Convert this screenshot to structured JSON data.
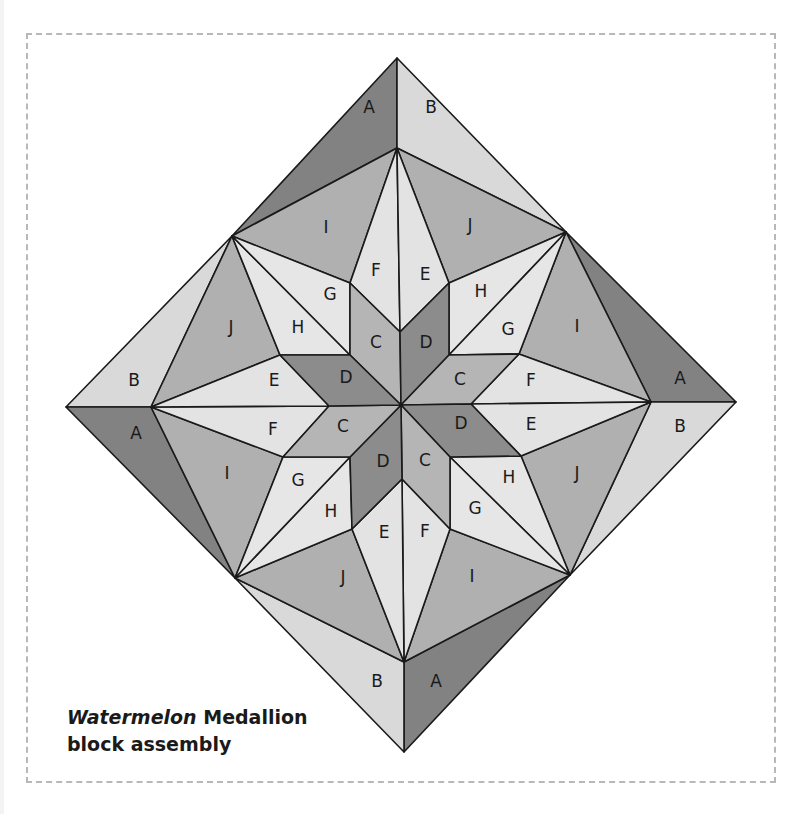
{
  "caption": {
    "italic": "Watermelon",
    "rest": " Medallion",
    "line2": "block assembly"
  },
  "colors": {
    "A": "#828282",
    "B": "#d9d9d9",
    "C": "#b5b5b5",
    "D": "#8c8c8c",
    "E": "#e3e3e3",
    "F": "#e3e3e3",
    "G": "#e6e6e6",
    "H": "#e6e6e6",
    "I": "#b0b0b0",
    "J": "#b0b0b0"
  },
  "pieces": [
    {
      "label": "A",
      "points": "397,58 232,236 397,148",
      "lx": 369,
      "ly": 107
    },
    {
      "label": "B",
      "points": "397,58 566,232 397,148",
      "lx": 431,
      "ly": 107
    },
    {
      "label": "A",
      "points": "736,402 566,232 651,402",
      "lx": 680,
      "ly": 378
    },
    {
      "label": "B",
      "points": "736,402 570,575 651,402",
      "lx": 680,
      "ly": 426
    },
    {
      "label": "A",
      "points": "404,752 570,575 404,662",
      "lx": 436,
      "ly": 681
    },
    {
      "label": "B",
      "points": "404,752 235,578 404,662",
      "lx": 377,
      "ly": 681
    },
    {
      "label": "B",
      "points": "66,407 232,236 151,407",
      "lx": 134,
      "ly": 380
    },
    {
      "label": "A",
      "points": "66,407 235,578 151,407",
      "lx": 136,
      "ly": 433
    },
    {
      "label": "I",
      "points": "397,148 232,236 350,283",
      "lx": 326,
      "ly": 227
    },
    {
      "label": "J",
      "points": "397,148 566,232 449,283",
      "lx": 470,
      "ly": 225
    },
    {
      "label": "I",
      "points": "651,402 566,232 519,354",
      "lx": 577,
      "ly": 326
    },
    {
      "label": "J",
      "points": "651,402 570,575 521,456",
      "lx": 577,
      "ly": 473
    },
    {
      "label": "I",
      "points": "404,662 570,575 450,529",
      "lx": 472,
      "ly": 576
    },
    {
      "label": "J",
      "points": "404,662 235,578 352,529",
      "lx": 343,
      "ly": 577
    },
    {
      "label": "I",
      "points": "151,407 235,578 283,457",
      "lx": 227,
      "ly": 473
    },
    {
      "label": "J",
      "points": "151,407 232,236 280,355",
      "lx": 231,
      "ly": 327
    },
    {
      "label": "F",
      "points": "397,148 350,283 400,332",
      "lx": 376,
      "ly": 270
    },
    {
      "label": "E",
      "points": "397,148 449,283 400,332",
      "lx": 425,
      "ly": 274
    },
    {
      "label": "H",
      "points": "566,232 449,283 449,355",
      "lx": 481,
      "ly": 291
    },
    {
      "label": "G",
      "points": "566,232 449,355 519,354",
      "lx": 508,
      "ly": 329
    },
    {
      "label": "F",
      "points": "651,402 519,354 471,404",
      "lx": 531,
      "ly": 380
    },
    {
      "label": "E",
      "points": "651,402 471,404 521,456",
      "lx": 531,
      "ly": 424
    },
    {
      "label": "H",
      "points": "570,575 521,456 450,457",
      "lx": 509,
      "ly": 477
    },
    {
      "label": "G",
      "points": "570,575 450,457 450,529",
      "lx": 475,
      "ly": 508
    },
    {
      "label": "F",
      "points": "404,662 450,529 402,479",
      "lx": 425,
      "ly": 531
    },
    {
      "label": "E",
      "points": "404,662 402,479 352,529",
      "lx": 384,
      "ly": 532
    },
    {
      "label": "H",
      "points": "235,578 352,529 350,457",
      "lx": 331,
      "ly": 511
    },
    {
      "label": "G",
      "points": "235,578 350,457 283,457",
      "lx": 298,
      "ly": 480
    },
    {
      "label": "F",
      "points": "151,407 283,457 329,406",
      "lx": 273,
      "ly": 429
    },
    {
      "label": "E",
      "points": "151,407 329,406 280,355",
      "lx": 274,
      "ly": 380
    },
    {
      "label": "H",
      "points": "232,236 280,355 350,355",
      "lx": 298,
      "ly": 327
    },
    {
      "label": "G",
      "points": "232,236 350,355 350,283",
      "lx": 330,
      "ly": 294
    },
    {
      "label": "C",
      "points": "401,405 350,355 350,283 400,332",
      "lx": 376,
      "ly": 342
    },
    {
      "label": "D",
      "points": "401,405 400,332 449,283 449,355",
      "lx": 426,
      "ly": 342
    },
    {
      "label": "C",
      "points": "401,405 449,355 519,354 471,404",
      "lx": 460,
      "ly": 379
    },
    {
      "label": "D",
      "points": "401,405 471,404 521,456 450,457",
      "lx": 461,
      "ly": 423
    },
    {
      "label": "C",
      "points": "401,405 450,457 450,529 402,479",
      "lx": 425,
      "ly": 460
    },
    {
      "label": "D",
      "points": "401,405 402,479 352,529 350,457",
      "lx": 383,
      "ly": 461
    },
    {
      "label": "C",
      "points": "401,405 350,457 283,457 329,406",
      "lx": 343,
      "ly": 426
    },
    {
      "label": "D",
      "points": "401,405 329,406 280,355 350,355",
      "lx": 346,
      "ly": 377
    }
  ]
}
